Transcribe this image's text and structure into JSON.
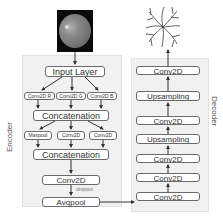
{
  "encoder": {
    "label": "Encoder",
    "input_image": "retinal-fundus-image",
    "input_layer": "Input Layer",
    "branch_convs": [
      "Conv2D R",
      "Conv2D G",
      "Conv2D B"
    ],
    "concat_1": "Concatenation",
    "branch_2": [
      "Maxpool",
      "Conv2D",
      "Conv2D"
    ],
    "concat_2": "Concatenation",
    "conv": "Conv2D",
    "dropout_label": "dropout",
    "avgpool": "Avgpool"
  },
  "decoder": {
    "label": "Decoder",
    "output_image": "vessel-segmentation-image",
    "layers_top_to_bottom": [
      "Conv2D",
      "Upsampling",
      "Conv2D",
      "Upsampling",
      "Conv2D",
      "Conv2D",
      "Conv2D"
    ]
  },
  "colors": {
    "panel_bg": "#f1f1f1",
    "box_border": "#6a6a6a",
    "arrow": "#333333",
    "text": "#333333"
  }
}
